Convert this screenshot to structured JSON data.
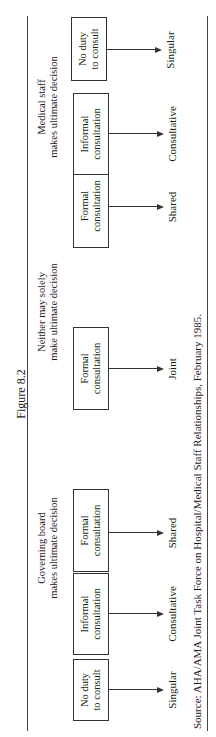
{
  "figure": {
    "title": "Figure 8.2",
    "groups": [
      {
        "label_line1": "Governing board",
        "label_line2": "makes ultimate decision"
      },
      {
        "label_line1": "Neither may solely",
        "label_line2": "make ultimate decision"
      },
      {
        "label_line1": "Medical staff",
        "label_line2": "makes ultimate decision"
      }
    ],
    "nodes": [
      {
        "line1": "No duty",
        "line2": "to consult",
        "outcome": "Singular"
      },
      {
        "line1": "Informal",
        "line2": "consultation",
        "outcome": "Consultative"
      },
      {
        "line1": "Formal",
        "line2": "consultation",
        "outcome": "Shared"
      },
      {
        "line1": "Formal",
        "line2": "consultation",
        "outcome": "Joint"
      },
      {
        "line1": "Formal",
        "line2": "consultation",
        "outcome": "Shared"
      },
      {
        "line1": "Informal",
        "line2": "consultation",
        "outcome": "Consultative"
      },
      {
        "line1": "No duty",
        "line2": "to consult",
        "outcome": "Singular"
      }
    ],
    "source": "Source: AHA/AMA Joint Task Force on Hospital/Medical Staff Relationships, February 1985."
  }
}
